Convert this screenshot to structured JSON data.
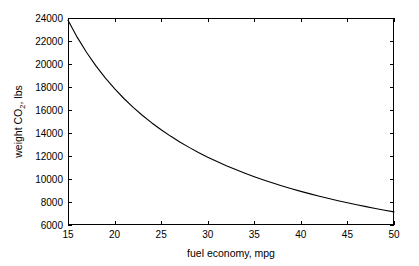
{
  "chart_data": {
    "type": "line",
    "title": "",
    "xlabel": "fuel economy, mpg",
    "ylabel": "weight CO2, lbs",
    "ylabel_parts": {
      "before": "weight CO",
      "subscript": "2",
      "after": ", lbs"
    },
    "xlim": [
      15,
      50
    ],
    "ylim": [
      6000,
      24000
    ],
    "xticks": [
      15,
      20,
      25,
      30,
      35,
      40,
      45,
      50
    ],
    "xticklabels": [
      "15",
      "20",
      "25",
      "30",
      "35",
      "40",
      "45",
      "50"
    ],
    "yticks": [
      6000,
      8000,
      10000,
      12000,
      14000,
      16000,
      18000,
      20000,
      22000,
      24000
    ],
    "yticklabels": [
      "6000",
      "8000",
      "10000",
      "12000",
      "14000",
      "16000",
      "18000",
      "20000",
      "22000",
      "24000"
    ],
    "grid": false,
    "legend": false,
    "line_color": "#000000",
    "background_color": "#ffffff",
    "axes_color": "#000000",
    "relation": "weight CO2 = 357000 / mpg",
    "series": [
      {
        "name": "weight CO2",
        "x": [
          15,
          16,
          17,
          18,
          19,
          20,
          21,
          22,
          23,
          24,
          25,
          26,
          27,
          28,
          29,
          30,
          31,
          32,
          33,
          34,
          35,
          36,
          37,
          38,
          39,
          40,
          41,
          42,
          43,
          44,
          45,
          46,
          47,
          48,
          49,
          50
        ],
        "values": [
          23800,
          22313,
          21000,
          19833,
          18789,
          17850,
          17000,
          16227,
          15522,
          14875,
          14280,
          13731,
          13222,
          12750,
          12310,
          11900,
          11516,
          11156,
          10818,
          10500,
          10200,
          9917,
          9649,
          9395,
          9154,
          8925,
          8707,
          8500,
          8302,
          8114,
          7933,
          7761,
          7596,
          7438,
          7286,
          7140
        ]
      }
    ]
  },
  "figure": {
    "plot_box": {
      "left_px": 68,
      "top_px": 18,
      "right_px": 394,
      "bottom_px": 225
    }
  }
}
